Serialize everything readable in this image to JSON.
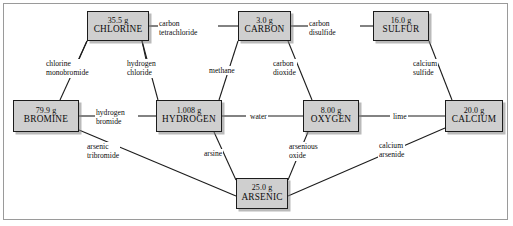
{
  "diagram": {
    "type": "node-link-diagram",
    "style": {
      "node_fill": "#cfcfcf",
      "node_border": "#1c1c1c",
      "line_color": "#1c1c1c",
      "background": "#ffffff"
    },
    "nodes": [
      {
        "id": "chlorine",
        "mass": "35.5 g",
        "name": "CHLORINE",
        "x": 87,
        "y": 11,
        "w": 62,
        "h": 30
      },
      {
        "id": "carbon",
        "mass": "3.0 g",
        "name": "CARBON",
        "x": 238,
        "y": 11,
        "w": 53,
        "h": 30
      },
      {
        "id": "sulfur",
        "mass": "16.0 g",
        "name": "SULFUR",
        "x": 373,
        "y": 11,
        "w": 56,
        "h": 30
      },
      {
        "id": "bromine",
        "mass": "79.9 g",
        "name": "BROMINE",
        "x": 13,
        "y": 100,
        "w": 66,
        "h": 32
      },
      {
        "id": "hydrogen",
        "mass": "1.008 g",
        "name": "HYDROGEN",
        "x": 156,
        "y": 100,
        "w": 66,
        "h": 32
      },
      {
        "id": "oxygen",
        "mass": "8.00 g",
        "name": "OXYGEN",
        "x": 303,
        "y": 100,
        "w": 56,
        "h": 32
      },
      {
        "id": "calcium",
        "mass": "20.0 g",
        "name": "CALCIUM",
        "x": 445,
        "y": 100,
        "w": 58,
        "h": 32
      },
      {
        "id": "arsenic",
        "mass": "25.0 g",
        "name": "ARSENIC",
        "x": 236,
        "y": 178,
        "w": 52,
        "h": 31
      }
    ],
    "edges": [
      {
        "id": "e1",
        "from": "chlorine",
        "to": "carbon",
        "label": "carbon\ntetrachloride",
        "lx": 158,
        "ly": 19,
        "align": "lft"
      },
      {
        "id": "e2",
        "from": "carbon",
        "to": "sulfur",
        "label": "carbon\ndisulfide",
        "lx": 308,
        "ly": 19,
        "align": "lft"
      },
      {
        "id": "e3",
        "from": "bromine",
        "to": "chlorine",
        "label": "chlorine\nmonobromide",
        "lx": 45,
        "ly": 59,
        "align": "lft"
      },
      {
        "id": "e4",
        "from": "hydrogen",
        "to": "chlorine",
        "label": "hydrogen\nchloride",
        "lx": 126,
        "ly": 59,
        "align": "lft"
      },
      {
        "id": "e5",
        "from": "hydrogen",
        "to": "carbon",
        "label": "methane",
        "lx": 208,
        "ly": 66,
        "align": "lft"
      },
      {
        "id": "e6",
        "from": "oxygen",
        "to": "carbon",
        "label": "carbon\ndioxide",
        "lx": 272,
        "ly": 59,
        "align": "lft"
      },
      {
        "id": "e7",
        "from": "calcium",
        "to": "sulfur",
        "label": "calcium\nsulfide",
        "lx": 412,
        "ly": 59,
        "align": "lft"
      },
      {
        "id": "e8",
        "from": "bromine",
        "to": "hydrogen",
        "label": "hydrogen\nbromide",
        "lx": 95,
        "ly": 108,
        "align": "lft"
      },
      {
        "id": "e9",
        "from": "hydrogen",
        "to": "oxygen",
        "label": "water",
        "lx": 249,
        "ly": 112,
        "align": "lft"
      },
      {
        "id": "e10",
        "from": "oxygen",
        "to": "calcium",
        "label": "lime",
        "lx": 392,
        "ly": 112,
        "align": "lft"
      },
      {
        "id": "e11",
        "from": "bromine",
        "to": "arsenic",
        "label": "arsenic\ntribromide",
        "lx": 86,
        "ly": 142,
        "align": "lft"
      },
      {
        "id": "e12",
        "from": "hydrogen",
        "to": "arsenic",
        "label": "arsine",
        "lx": 203,
        "ly": 149,
        "align": "lft"
      },
      {
        "id": "e13",
        "from": "oxygen",
        "to": "arsenic",
        "label": "arsenious\noxide",
        "lx": 288,
        "ly": 142,
        "align": "lft"
      },
      {
        "id": "e14",
        "from": "calcium",
        "to": "arsenic",
        "label": "calcium\narsenide",
        "lx": 378,
        "ly": 141,
        "align": "lft"
      }
    ],
    "lines": [
      {
        "id": "l1",
        "x1": 149,
        "y1": 26,
        "x2": 172,
        "y2": 26
      },
      {
        "id": "l1b",
        "x1": 218,
        "y1": 26,
        "x2": 238,
        "y2": 26
      },
      {
        "id": "l2",
        "x1": 291,
        "y1": 26,
        "x2": 316,
        "y2": 26
      },
      {
        "id": "l2b",
        "x1": 360,
        "y1": 26,
        "x2": 373,
        "y2": 26
      },
      {
        "id": "l3",
        "x1": 60,
        "y1": 100,
        "x2": 87,
        "y2": 41
      },
      {
        "id": "l3b",
        "x1": 72,
        "y1": 75,
        "x2": 87,
        "y2": 41
      },
      {
        "id": "l4",
        "x1": 158,
        "y1": 100,
        "x2": 142,
        "y2": 41
      },
      {
        "id": "l4b",
        "x1": 150,
        "y1": 78,
        "x2": 142,
        "y2": 41
      },
      {
        "id": "l5",
        "x1": 219,
        "y1": 100,
        "x2": 238,
        "y2": 41
      },
      {
        "id": "l6",
        "x1": 312,
        "y1": 100,
        "x2": 288,
        "y2": 41
      },
      {
        "id": "l7",
        "x1": 452,
        "y1": 100,
        "x2": 429,
        "y2": 41
      },
      {
        "id": "l8",
        "x1": 79,
        "y1": 116,
        "x2": 102,
        "y2": 116
      },
      {
        "id": "l8b",
        "x1": 138,
        "y1": 116,
        "x2": 156,
        "y2": 116
      },
      {
        "id": "l9",
        "x1": 222,
        "y1": 116,
        "x2": 246,
        "y2": 116
      },
      {
        "id": "l9b",
        "x1": 268,
        "y1": 116,
        "x2": 303,
        "y2": 116
      },
      {
        "id": "l10",
        "x1": 359,
        "y1": 116,
        "x2": 390,
        "y2": 116
      },
      {
        "id": "l10b",
        "x1": 408,
        "y1": 116,
        "x2": 445,
        "y2": 116
      },
      {
        "id": "l11",
        "x1": 79,
        "y1": 130,
        "x2": 236,
        "y2": 196
      },
      {
        "id": "l12",
        "x1": 214,
        "y1": 132,
        "x2": 236,
        "y2": 180
      },
      {
        "id": "l13",
        "x1": 308,
        "y1": 132,
        "x2": 288,
        "y2": 180
      },
      {
        "id": "l14",
        "x1": 445,
        "y1": 128,
        "x2": 288,
        "y2": 196
      }
    ]
  }
}
